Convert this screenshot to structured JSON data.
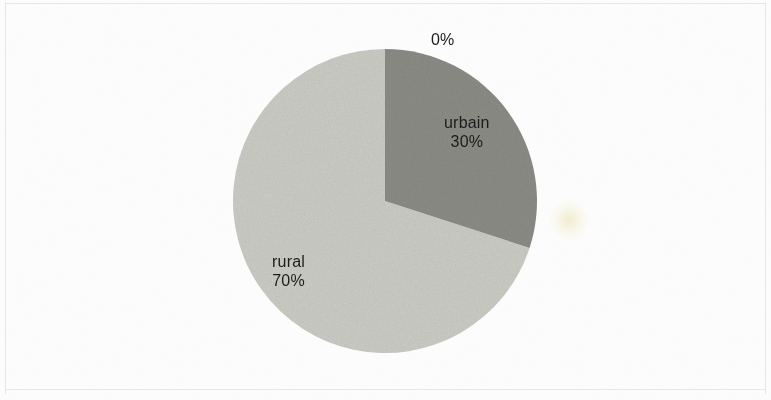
{
  "figure": {
    "background_color": "#fdfdfd",
    "frame_color": "#e8e8e6"
  },
  "chart_data": {
    "type": "pie",
    "title": "",
    "subtitle": "",
    "xlabel": "",
    "ylabel": "",
    "grid": false,
    "legend": "none",
    "labels_position": "inside-and-outside",
    "start_angle_deg": 90,
    "direction": "clockwise",
    "categories": [
      "0%",
      "urbain",
      "rural"
    ],
    "values": [
      0,
      30,
      70
    ],
    "value_unit": "%",
    "slices": [
      {
        "name": "",
        "value": 0,
        "value_label": "0%",
        "name_label": "",
        "color": "#ffffff",
        "label_placement": "outside-top"
      },
      {
        "name": "urbain",
        "value": 30,
        "value_label": "30%",
        "name_label": "urbain",
        "color": "#8d8d87",
        "label_placement": "inside"
      },
      {
        "name": "rural",
        "value": 70,
        "value_label": "70%",
        "name_label": "rural",
        "color": "#cdcdc7",
        "label_placement": "inside"
      }
    ],
    "annotations": []
  },
  "labels": {
    "zero": "0%",
    "urbain_name": "urbain",
    "urbain_value": "30%",
    "rural_name": "rural",
    "rural_value": "70%"
  }
}
